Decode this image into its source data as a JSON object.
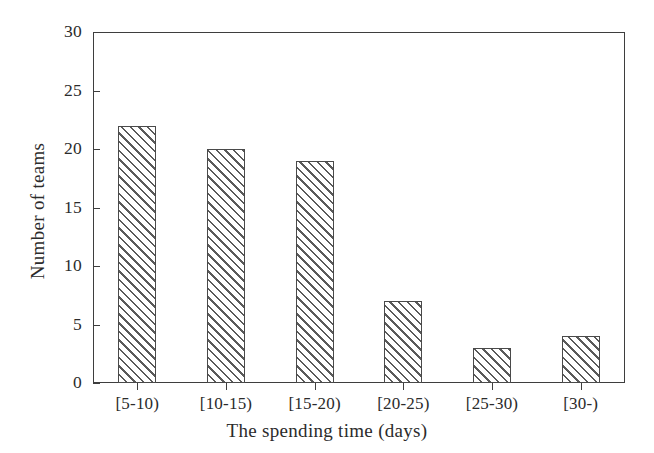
{
  "chart_data": {
    "type": "bar",
    "title": "",
    "subtitle": "",
    "categories": [
      "[5-10)",
      "[10-15)",
      "[15-20)",
      "[20-25)",
      "[25-30)",
      "[30-)"
    ],
    "values": [
      22,
      20,
      19,
      7,
      3,
      4
    ],
    "series": [
      {
        "name": "Number of teams",
        "values": [
          22,
          20,
          19,
          7,
          3,
          4
        ]
      }
    ],
    "xlabel": "The spending time (days)",
    "ylabel": "Number of teams",
    "ylim": [
      0,
      30
    ],
    "ytick_labels": [
      "0",
      "5",
      "10",
      "15",
      "20",
      "25",
      "30"
    ],
    "ytick_values": [
      0,
      5,
      10,
      15,
      20,
      25,
      30
    ],
    "xtick_labels": [
      "[5-10)",
      "[10-15)",
      "[15-20)",
      "[20-25)",
      "[25-30)",
      "[30-)"
    ],
    "grid": false,
    "legend": null,
    "legend_position": "none",
    "bar_fill": "diagonal-hatch",
    "annotations": [],
    "colors": {
      "axis": "#3e3e3e",
      "text": "#2b2b2b",
      "bar_edge": "#4a4a4a",
      "bar_hatch": "#5a5a5a",
      "background": "#ffffff"
    }
  }
}
